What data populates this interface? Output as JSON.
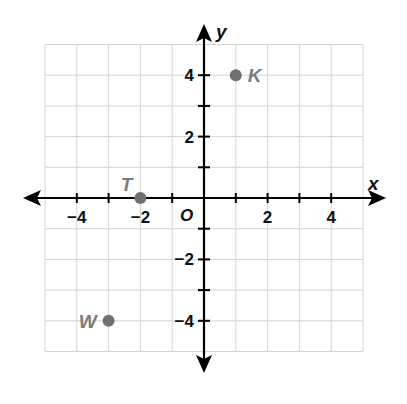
{
  "chart_data": {
    "type": "scatter",
    "title": "",
    "xlabel": "x",
    "ylabel": "y",
    "origin_label": "O",
    "xlim": [
      -5,
      5
    ],
    "ylim": [
      -5,
      5
    ],
    "grid": true,
    "x_ticks": [
      -4,
      -3,
      -2,
      -1,
      1,
      2,
      3,
      4
    ],
    "y_ticks": [
      -4,
      -3,
      -2,
      -1,
      1,
      2,
      3,
      4
    ],
    "x_tick_labels": [
      {
        "value": -4,
        "text": "−4"
      },
      {
        "value": -2,
        "text": "−2"
      },
      {
        "value": 2,
        "text": "2"
      },
      {
        "value": 4,
        "text": "4"
      }
    ],
    "y_tick_labels": [
      {
        "value": 4,
        "text": "4"
      },
      {
        "value": 2,
        "text": "2"
      },
      {
        "value": -2,
        "text": "−2"
      },
      {
        "value": -4,
        "text": "−4"
      }
    ],
    "points": [
      {
        "label": "K",
        "x": 1,
        "y": 4,
        "label_side": "right"
      },
      {
        "label": "T",
        "x": -2,
        "y": 0,
        "label_side": "above-left"
      },
      {
        "label": "W",
        "x": -3,
        "y": -4,
        "label_side": "left"
      }
    ]
  },
  "colors": {
    "grid": "#d4d4d4",
    "axis": "#000000",
    "point": "#707070",
    "point_label": "#7a7a7a"
  }
}
